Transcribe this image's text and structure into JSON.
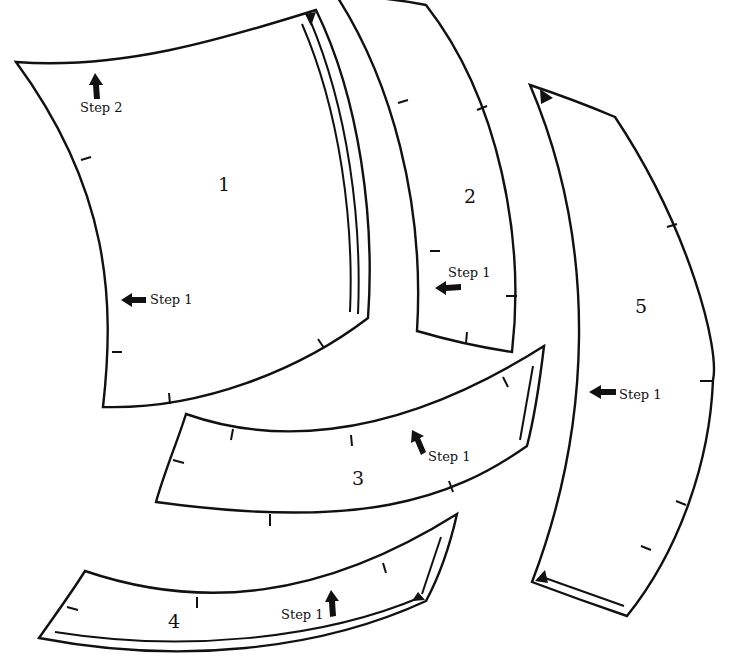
{
  "diagram": {
    "type": "sewing pattern pieces",
    "colors": {
      "outline": "#111111",
      "background": "#ffffff"
    },
    "pieces": [
      {
        "number": "1",
        "steps": [
          {
            "label": "Step 1",
            "arrow": "left"
          },
          {
            "label": "Step 2",
            "arrow": "up"
          }
        ]
      },
      {
        "number": "2",
        "steps": [
          {
            "label": "Step 1",
            "arrow": "left"
          }
        ]
      },
      {
        "number": "3",
        "steps": [
          {
            "label": "Step 1",
            "arrow": "up-left"
          }
        ]
      },
      {
        "number": "4",
        "steps": [
          {
            "label": "Step 1",
            "arrow": "up"
          }
        ]
      },
      {
        "number": "5",
        "steps": [
          {
            "label": "Step 1",
            "arrow": "left"
          }
        ]
      }
    ]
  }
}
